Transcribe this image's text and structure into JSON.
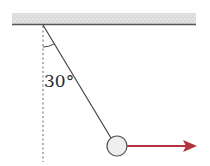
{
  "diagram": {
    "angle_label": "30°",
    "colors": {
      "ceiling_fill": "#d8d8d8",
      "ceiling_line": "#555555",
      "string": "#444444",
      "dashed_line": "#666666",
      "ball_fill": "#eeeeee",
      "ball_stroke": "#555555",
      "force_arrow": "#b3323c"
    },
    "elements": {
      "ceiling": {
        "x1": 12,
        "x2": 196,
        "y_top": 13,
        "y_bottom": 25
      },
      "pivot": {
        "x": 43,
        "y": 25
      },
      "ball": {
        "cx": 117,
        "cy": 146,
        "r": 10
      },
      "vertical_reference": {
        "x": 43,
        "y1": 25,
        "y2": 162
      },
      "force_arrow": {
        "x1": 127,
        "x2": 196,
        "y": 146
      }
    }
  }
}
